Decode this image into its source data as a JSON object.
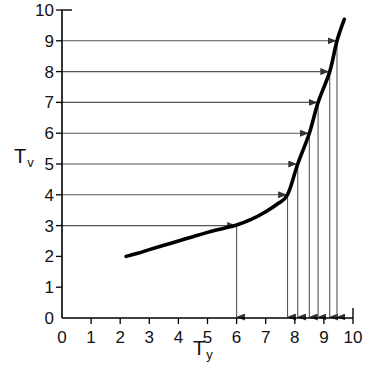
{
  "chart_data": {
    "type": "line",
    "title": "",
    "xlabel": "Ty",
    "ylabel": "Tv",
    "xlabel_base": "T",
    "xlabel_sub": "y",
    "ylabel_base": "T",
    "ylabel_sub": "v",
    "xlim": [
      0,
      10
    ],
    "ylim": [
      0,
      10
    ],
    "xticks": [
      0,
      1,
      2,
      3,
      4,
      5,
      6,
      7,
      8,
      9,
      10
    ],
    "yticks": [
      0,
      1,
      2,
      3,
      4,
      5,
      6,
      7,
      8,
      9,
      10
    ],
    "xtick_labels": [
      "0",
      "1",
      "2",
      "3",
      "4",
      "5",
      "6",
      "7",
      "8",
      "9",
      "10"
    ],
    "ytick_labels": [
      "0",
      "1",
      "2",
      "3",
      "4",
      "5",
      "6",
      "7",
      "8",
      "9",
      "10"
    ],
    "grid": false,
    "legend": null,
    "curve_color": "#000000",
    "arrow_color": "#555555",
    "series": [
      {
        "name": "transfer curve",
        "points": [
          [
            2.2,
            2.0
          ],
          [
            2.6,
            2.1
          ],
          [
            3.0,
            2.22
          ],
          [
            3.5,
            2.36
          ],
          [
            4.0,
            2.5
          ],
          [
            4.5,
            2.64
          ],
          [
            5.0,
            2.78
          ],
          [
            5.5,
            2.9
          ],
          [
            6.0,
            3.02
          ],
          [
            6.5,
            3.2
          ],
          [
            7.0,
            3.45
          ],
          [
            7.4,
            3.7
          ],
          [
            7.75,
            4.0
          ],
          [
            8.1,
            5.0
          ],
          [
            8.5,
            6.0
          ],
          [
            8.8,
            7.0
          ],
          [
            9.2,
            8.0
          ],
          [
            9.45,
            9.0
          ],
          [
            9.7,
            9.7
          ]
        ]
      }
    ],
    "horizontal_arrows": [
      {
        "label": "Tv = 9",
        "y": 9,
        "x_start": 0,
        "x_end": 9.45
      },
      {
        "label": "Tv = 8",
        "y": 8,
        "x_start": 0,
        "x_end": 9.2
      },
      {
        "label": "Tv = 7",
        "y": 7,
        "x_start": 0,
        "x_end": 8.8
      },
      {
        "label": "Tv = 6",
        "y": 6,
        "x_start": 0,
        "x_end": 8.5
      },
      {
        "label": "Tv = 5",
        "y": 5,
        "x_start": 0,
        "x_end": 8.1
      },
      {
        "label": "Tv = 4",
        "y": 4,
        "x_start": 0,
        "x_end": 7.75
      },
      {
        "label": "Tv = 3",
        "y": 3,
        "x_start": 0,
        "x_end": 6.0
      }
    ],
    "vertical_arrows": [
      {
        "label": "Ty = 6.0",
        "x": 6.0,
        "y_start": 3,
        "y_end": 0
      },
      {
        "label": "Ty = 7.75",
        "x": 7.75,
        "y_start": 4,
        "y_end": 0
      },
      {
        "label": "Ty = 8.1",
        "x": 8.1,
        "y_start": 5,
        "y_end": 0
      },
      {
        "label": "Ty = 8.5",
        "x": 8.5,
        "y_start": 6,
        "y_end": 0
      },
      {
        "label": "Ty = 8.8",
        "x": 8.8,
        "y_start": 7,
        "y_end": 0
      },
      {
        "label": "Ty = 9.2",
        "x": 9.2,
        "y_start": 8,
        "y_end": 0
      },
      {
        "label": "Ty = 9.45",
        "x": 9.45,
        "y_start": 9,
        "y_end": 0
      }
    ]
  }
}
